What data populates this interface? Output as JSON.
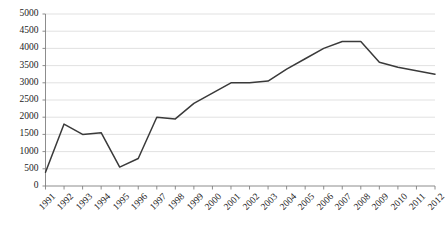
{
  "chart_data": {
    "type": "line",
    "title": "",
    "subtitle": "",
    "xlabel": "",
    "ylabel": "",
    "categories": [
      "1991",
      "1992",
      "1993",
      "1994",
      "1995",
      "1996",
      "1997",
      "1998",
      "1999",
      "2000",
      "2001",
      "2002",
      "2003",
      "2004",
      "2005",
      "2006",
      "2007",
      "2008",
      "2009",
      "2010",
      "2011",
      "2012"
    ],
    "values": [
      400,
      1800,
      1500,
      1550,
      550,
      800,
      2000,
      1950,
      2400,
      2700,
      3000,
      3000,
      3050,
      3400,
      3700,
      4000,
      4200,
      4200,
      3600,
      3450,
      3350,
      3250
    ],
    "series": [
      {
        "name": "series-1",
        "color": "#3a3a3a",
        "values": [
          400,
          1800,
          1500,
          1550,
          550,
          800,
          2000,
          1950,
          2400,
          2700,
          3000,
          3000,
          3050,
          3400,
          3700,
          4000,
          4200,
          4200,
          3600,
          3450,
          3350,
          3250
        ]
      }
    ],
    "ylim": [
      0,
      5000
    ],
    "yticks": [
      0,
      500,
      1000,
      1500,
      2000,
      2500,
      3000,
      3500,
      4000,
      4500,
      5000
    ],
    "ytick_labels": [
      "0",
      "500",
      "1000",
      "1500",
      "2000",
      "2500",
      "3000",
      "3500",
      "4000",
      "4500",
      "5000"
    ],
    "xtick_labels": [
      "1991",
      "1992",
      "1993",
      "1994",
      "1995",
      "1996",
      "1997",
      "1998",
      "1999",
      "2000",
      "2001",
      "2002",
      "2003",
      "2004",
      "2005",
      "2006",
      "2007",
      "2008",
      "2009",
      "2010",
      "2011",
      "2012"
    ],
    "grid": true,
    "grid_axis": "y",
    "legend": false,
    "legend_position": "none",
    "markers": false,
    "colors": {
      "line": "#3a3a3a",
      "gridline": "#d9d9d9",
      "axis": "#808080",
      "text": "#1c1c1c",
      "background": "#ffffff"
    }
  }
}
